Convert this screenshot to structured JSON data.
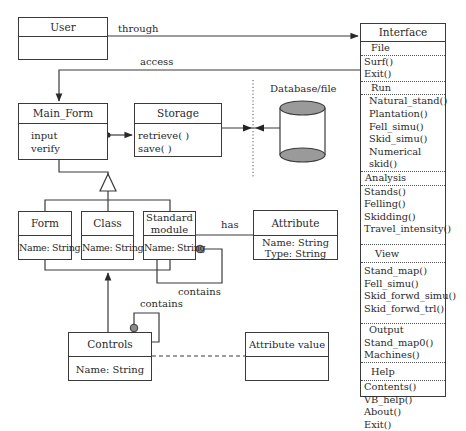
{
  "diagram": {
    "type": "uml-class-diagram",
    "classes": {
      "user": {
        "name": "User",
        "members": []
      },
      "main_form": {
        "name": "Main_Form",
        "members": [
          "input",
          "verify"
        ]
      },
      "storage": {
        "name": "Storage",
        "members": [
          "retrieve( )",
          "save( )"
        ]
      },
      "form": {
        "name": "Form",
        "members": [
          "Name: String"
        ]
      },
      "class": {
        "name": "Class",
        "members": [
          "Name: String"
        ]
      },
      "standard_module": {
        "name_line1": "Standard",
        "name_line2": "module",
        "members": [
          "Name: String"
        ]
      },
      "attribute": {
        "name": "Attribute",
        "members": [
          "Name: String",
          "Type: String"
        ]
      },
      "controls": {
        "name": "Controls",
        "members": [
          "Name: String"
        ]
      },
      "attribute_value": {
        "name": "Attribute value",
        "members": []
      }
    },
    "database": {
      "label": "Database/file"
    },
    "interface": {
      "title": "Interface",
      "sections": [
        {
          "title": "File",
          "items": [
            "Surf()",
            "Exit()"
          ]
        },
        {
          "title": "Run",
          "items": [
            "Natural_stand()",
            "Plantation()",
            "Fell_simu()",
            "Skid_simu()",
            "Numerical skid()"
          ]
        },
        {
          "title": "Analysis",
          "items": [
            "Stands()",
            "Felling()",
            "Skidding()",
            "Travel_intensity()"
          ]
        },
        {
          "title": "View",
          "items": [
            "Stand_map()",
            "Fell_simu()",
            "Skid_forwd_simu()",
            "Skid_forwd_trl()"
          ]
        },
        {
          "title": "Output",
          "items": [
            "Stand_map0()",
            "Machines()"
          ]
        },
        {
          "title": "Help",
          "items": [
            "Contents()",
            "VB_help()",
            "About()",
            "Exit()"
          ]
        }
      ]
    },
    "relations": {
      "through": "through",
      "access": "access",
      "has": "has",
      "contains_module": "contains",
      "contains_controls": "contains"
    }
  }
}
